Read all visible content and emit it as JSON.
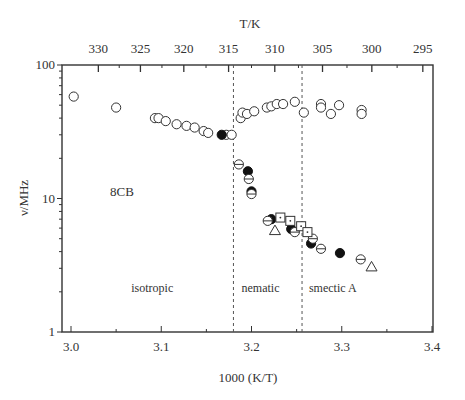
{
  "chart_data": {
    "type": "scatter",
    "title": "",
    "sample_label": "8CB",
    "xlabel": "1000 (K/T)",
    "ylabel": "ν/MHz",
    "top_xlabel": "T/K",
    "xlim": [
      2.99,
      3.4
    ],
    "ylim": [
      1,
      100
    ],
    "yscale": "log",
    "x_ticks": [
      "3.0",
      "3.1",
      "3.2",
      "3.3",
      "3.4"
    ],
    "x_tick_values": [
      3.0,
      3.1,
      3.2,
      3.3,
      3.4
    ],
    "y_ticks": [
      "1",
      "10",
      "100"
    ],
    "y_tick_values": [
      1,
      10,
      100
    ],
    "top_ticks": [
      "330",
      "325",
      "320",
      "315",
      "310",
      "305",
      "300",
      "295"
    ],
    "top_tick_values": [
      330,
      325,
      320,
      315,
      310,
      305,
      300,
      295
    ],
    "phase_boundaries": [
      3.18,
      3.256
    ],
    "phase_labels": [
      {
        "text": "isotropic",
        "x": 3.09,
        "y": 2.0
      },
      {
        "text": "nematic",
        "x": 3.21,
        "y": 2.0
      },
      {
        "text": "smectic A",
        "x": 3.29,
        "y": 2.0
      }
    ],
    "series": [
      {
        "name": "open circles (upper branch)",
        "marker": "circle-open",
        "points": [
          [
            3.003,
            58
          ],
          [
            3.05,
            48
          ],
          [
            3.093,
            40
          ],
          [
            3.097,
            40
          ],
          [
            3.105,
            38
          ],
          [
            3.117,
            36
          ],
          [
            3.128,
            35
          ],
          [
            3.137,
            34
          ],
          [
            3.147,
            32
          ],
          [
            3.152,
            31
          ],
          [
            3.172,
            30
          ],
          [
            3.178,
            30
          ],
          [
            3.188,
            40
          ],
          [
            3.19,
            44
          ],
          [
            3.195,
            43
          ],
          [
            3.203,
            45
          ],
          [
            3.217,
            48
          ],
          [
            3.222,
            49
          ],
          [
            3.228,
            51
          ],
          [
            3.235,
            51
          ],
          [
            3.248,
            53
          ],
          [
            3.258,
            44
          ],
          [
            3.277,
            51
          ],
          [
            3.277,
            48
          ],
          [
            3.288,
            43
          ],
          [
            3.297,
            50
          ],
          [
            3.322,
            46
          ],
          [
            3.322,
            43
          ]
        ]
      },
      {
        "name": "filled circles",
        "marker": "circle-filled",
        "points": [
          [
            3.167,
            30
          ],
          [
            3.196,
            16
          ],
          [
            3.2,
            11.3
          ],
          [
            3.222,
            7
          ],
          [
            3.244,
            5.9
          ],
          [
            3.266,
            4.6
          ],
          [
            3.298,
            3.9
          ]
        ]
      },
      {
        "name": "barred circles (lower branch)",
        "marker": "circle-bar",
        "points": [
          [
            3.186,
            18
          ],
          [
            3.197,
            14
          ],
          [
            3.2,
            10.8
          ],
          [
            3.218,
            6.8
          ],
          [
            3.248,
            5.6
          ],
          [
            3.268,
            5.0
          ],
          [
            3.277,
            4.2
          ],
          [
            3.321,
            3.5
          ]
        ]
      },
      {
        "name": "open squares",
        "marker": "square-dot",
        "points": [
          [
            3.232,
            7.2
          ],
          [
            3.243,
            6.8
          ],
          [
            3.255,
            6.2
          ],
          [
            3.262,
            5.6
          ]
        ]
      },
      {
        "name": "open triangles",
        "marker": "triangle-open",
        "points": [
          [
            3.226,
            5.8
          ],
          [
            3.333,
            3.1
          ]
        ]
      }
    ],
    "grid": false,
    "legend": "none"
  }
}
